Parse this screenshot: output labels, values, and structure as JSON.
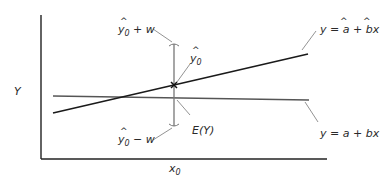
{
  "diagram": {
    "y_axis_label": "Y",
    "x_tick_label": "x",
    "x_tick_sub": "0",
    "upper_bound": {
      "y": "y",
      "sub": "0",
      "rest": " + w"
    },
    "lower_bound": {
      "y": "y",
      "sub": "0",
      "rest": " − w"
    },
    "prediction": {
      "y": "y",
      "sub": "0"
    },
    "expectation_label": "E(Y)",
    "fitted_line_label": "y = a + bx",
    "fitted_line_hat_note": "a and b hatted",
    "true_line_label": "y = a + bx",
    "colors": {
      "fitted_line": "#1a1a1a",
      "true_line": "#555555",
      "interval": "#777777",
      "axes": "#222222"
    }
  }
}
